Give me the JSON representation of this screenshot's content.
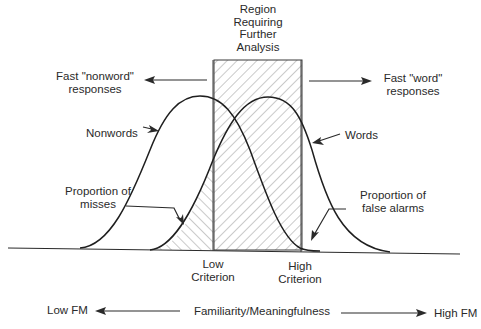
{
  "region": {
    "title_lines": [
      "Region",
      "Requiring",
      "Further",
      "Analysis"
    ]
  },
  "responses": {
    "nonword_line1": "Fast \"nonword\"",
    "nonword_line2": "responses",
    "word_line1": "Fast \"word\"",
    "word_line2": "responses"
  },
  "curves": {
    "nonwords_label": "Nonwords",
    "words_label": "Words"
  },
  "areas": {
    "misses_line1": "Proportion of",
    "misses_line2": "misses",
    "false_alarms_line1": "Proportion of",
    "false_alarms_line2": "false alarms"
  },
  "criteria": {
    "low_line1": "Low",
    "low_line2": "Criterion",
    "high_line1": "High",
    "high_line2": "Criterion"
  },
  "axis": {
    "left": "Low FM",
    "center": "Familiarity/Meaningfulness",
    "right": "High FM"
  },
  "colors": {
    "ink": "#2a2a2a",
    "background": "#ffffff",
    "hatch": "#8a8a8a"
  }
}
